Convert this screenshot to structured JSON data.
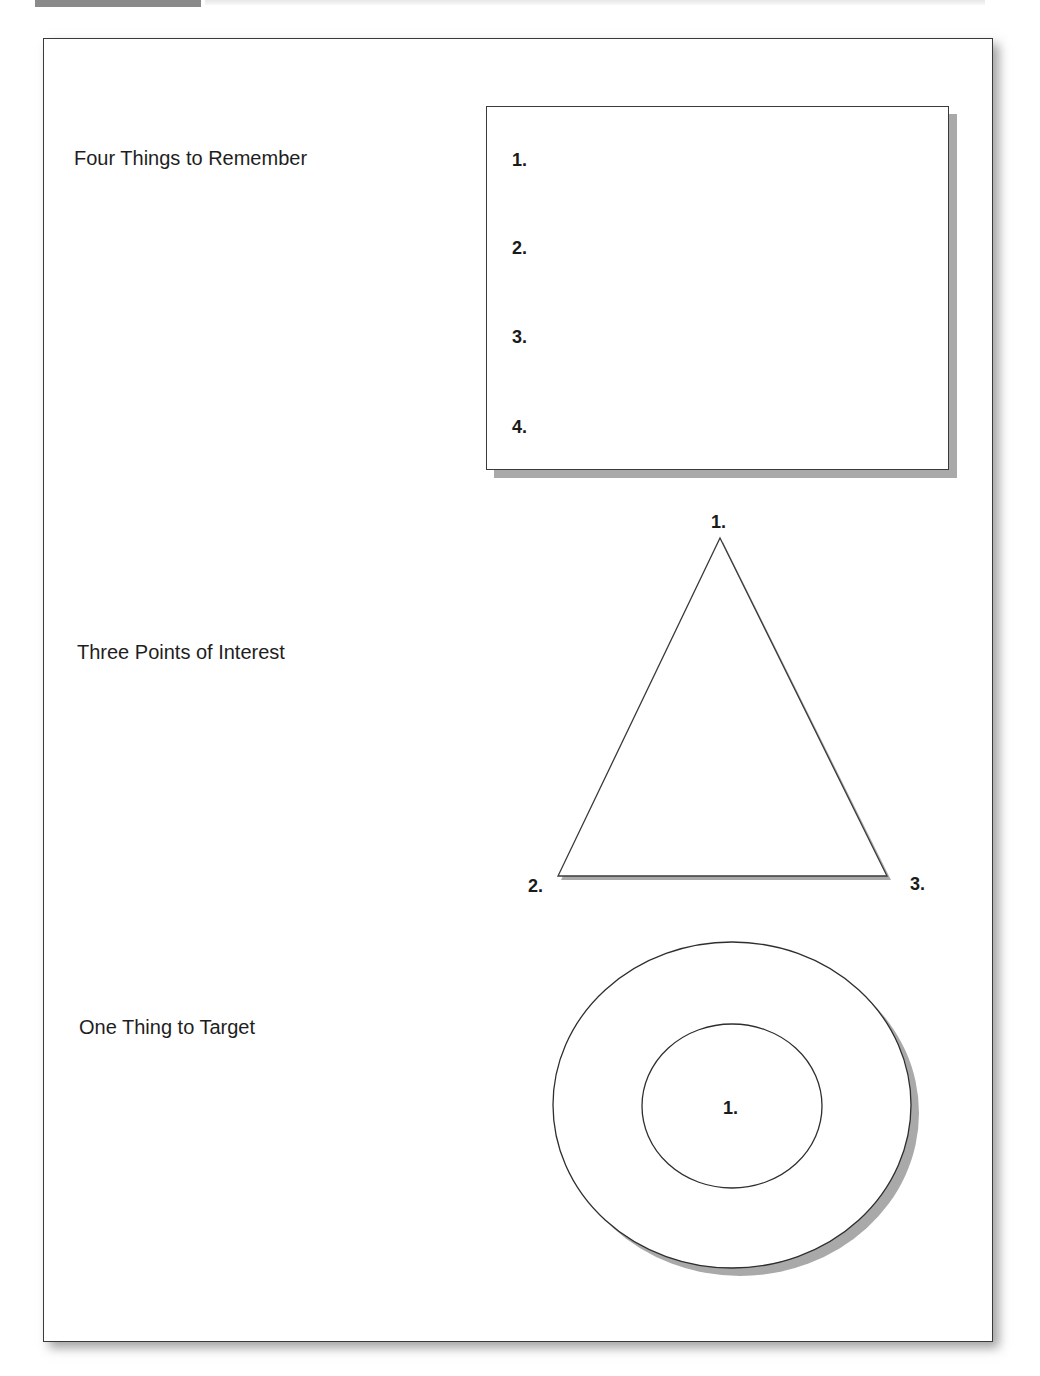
{
  "figure": {
    "rows": [
      {
        "label": "Four Things to Remember",
        "shape": "rectangle",
        "items": [
          "1.",
          "2.",
          "3.",
          "4."
        ]
      },
      {
        "label": "Three Points of Interest",
        "shape": "triangle",
        "items": [
          "1.",
          "2.",
          "3."
        ]
      },
      {
        "label": "One Thing to Target",
        "shape": "target",
        "items": [
          "1."
        ]
      }
    ]
  },
  "colors": {
    "stroke": "#3a3a3a",
    "shadow": "#a9a9a9",
    "caption_tab": "#8a8a8a",
    "text": "#1a1a1a"
  }
}
